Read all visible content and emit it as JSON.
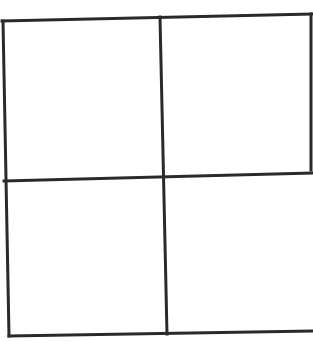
{
  "diagram": {
    "type": "grid",
    "rows": 2,
    "columns": 2,
    "cells": [
      {
        "row": 1,
        "col": 1,
        "content": ""
      },
      {
        "row": 1,
        "col": 2,
        "content": ""
      },
      {
        "row": 2,
        "col": 1,
        "content": ""
      },
      {
        "row": 2,
        "col": 2,
        "content": ""
      }
    ],
    "colors": {
      "background": "#ffffff",
      "stroke": "#2a2a2a"
    },
    "stroke_width": 3,
    "lines": {
      "top_edge": {
        "x1": 2,
        "y1": 21,
        "x2": 313,
        "y2": 14
      },
      "bottom_edge": {
        "x1": 9,
        "y1": 336,
        "x2": 313,
        "y2": 331
      },
      "middle_horizontal": {
        "x1": 4,
        "y1": 181,
        "x2": 313,
        "y2": 173
      },
      "left_edge": {
        "x1": 3,
        "y1": 21,
        "x2": 9,
        "y2": 336
      },
      "middle_vertical": {
        "x1": 160,
        "y1": 17,
        "x2": 167,
        "y2": 334
      },
      "right_edge_upper": {
        "x1": 311,
        "y1": 14,
        "x2": 311,
        "y2": 170
      }
    }
  }
}
